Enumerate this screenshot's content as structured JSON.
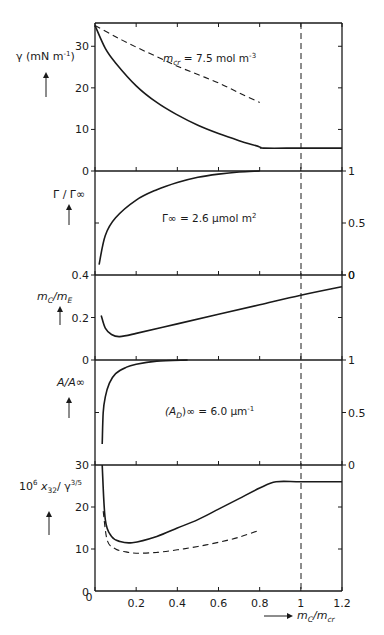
{
  "chart_data": {
    "type": "line",
    "layout": "five vertically stacked panels sharing x-axis",
    "xlabel": "m_C / m_cr",
    "xlim": [
      0,
      1.2
    ],
    "x_ticks": [
      "0",
      "0.2",
      "0.4",
      "0.6",
      "0.8",
      "1",
      "1.2"
    ],
    "vertical_reference_line": {
      "x": 1.0,
      "style": "dashed"
    },
    "panels": [
      {
        "id": "gamma",
        "ylabel": "γ (mN m⁻¹)",
        "yaxis_side": "left",
        "ylim": [
          0,
          35
        ],
        "y_ticks": [
          "0",
          "10",
          "20",
          "30"
        ],
        "annotation": "m_cr = 7.5 mol m⁻³",
        "series": [
          {
            "name": "solid",
            "style": "solid",
            "x": [
              0,
              0.05,
              0.1,
              0.2,
              0.3,
              0.4,
              0.5,
              0.6,
              0.7,
              0.8,
              0.82,
              1.0,
              1.2
            ],
            "y": [
              35,
              29.5,
              26,
              20.5,
              16.5,
              13.5,
              11,
              9,
              7.3,
              5.8,
              5.5,
              5.5,
              5.5
            ]
          },
          {
            "name": "dashed",
            "style": "dashed",
            "x": [
              0,
              0.1,
              0.2,
              0.3,
              0.4,
              0.5,
              0.6,
              0.7,
              0.8
            ],
            "y": [
              35,
              32.3,
              29.8,
              27.5,
              25.2,
              23.2,
              21.2,
              18.8,
              16.5
            ]
          }
        ]
      },
      {
        "id": "gamma_ratio",
        "ylabel": "Γ / Γ∞",
        "yaxis_side": "right",
        "ylim": [
          0,
          1
        ],
        "y_ticks": [
          "0",
          "0.5",
          "1"
        ],
        "annotation": "Γ∞ = 2.6 μmol m²",
        "series": [
          {
            "name": "solid",
            "style": "solid",
            "x": [
              0.02,
              0.05,
              0.1,
              0.2,
              0.3,
              0.4,
              0.5,
              0.6,
              0.7,
              0.8
            ],
            "y": [
              0.1,
              0.38,
              0.55,
              0.72,
              0.82,
              0.89,
              0.94,
              0.97,
              0.99,
              1.0
            ]
          }
        ]
      },
      {
        "id": "mc_me",
        "ylabel": "m_C / m_E",
        "yaxis_side": "left",
        "ylim": [
          0,
          0.4
        ],
        "y_ticks": [
          "0",
          "0.2",
          "0.4"
        ],
        "series": [
          {
            "name": "solid",
            "style": "solid",
            "x": [
              0.03,
              0.05,
              0.08,
              0.12,
              0.2,
              0.4,
              0.6,
              0.8,
              1.0,
              1.2
            ],
            "y": [
              0.21,
              0.15,
              0.12,
              0.11,
              0.125,
              0.17,
              0.215,
              0.26,
              0.305,
              0.345
            ]
          }
        ]
      },
      {
        "id": "area_ratio",
        "ylabel": "A / A∞",
        "yaxis_side": "right",
        "ylim": [
          0,
          1
        ],
        "y_ticks": [
          "0",
          "0.5",
          "1"
        ],
        "annotation": "(A_D)∞ = 6.0 μm⁻¹",
        "series": [
          {
            "name": "solid",
            "style": "solid",
            "x": [
              0.035,
              0.04,
              0.05,
              0.07,
              0.1,
              0.15,
              0.2,
              0.3,
              0.45
            ],
            "y": [
              0.2,
              0.5,
              0.65,
              0.78,
              0.87,
              0.93,
              0.96,
              0.99,
              1.0
            ]
          }
        ]
      },
      {
        "id": "x32",
        "ylabel": "10⁶ x₃₂ / γ^(3/5)",
        "yaxis_side": "left",
        "ylim": [
          0,
          30
        ],
        "y_ticks": [
          "0",
          "10",
          "20",
          "30"
        ],
        "series": [
          {
            "name": "solid",
            "style": "solid",
            "x": [
              0.035,
              0.05,
              0.08,
              0.12,
              0.18,
              0.3,
              0.4,
              0.5,
              0.6,
              0.7,
              0.8,
              0.88,
              1.0,
              1.2
            ],
            "y": [
              30,
              17,
              13,
              11.8,
              11.5,
              13,
              15,
              17,
              19.5,
              22,
              24.5,
              26,
              26,
              26
            ]
          },
          {
            "name": "dashed",
            "style": "dashed",
            "x": [
              0.04,
              0.06,
              0.1,
              0.15,
              0.2,
              0.3,
              0.4,
              0.5,
              0.6,
              0.7,
              0.8
            ],
            "y": [
              19,
              12,
              10,
              9.3,
              9,
              9.2,
              9.8,
              10.6,
              11.6,
              12.8,
              14.5
            ]
          }
        ]
      }
    ]
  },
  "labels": {
    "gamma_ylabel": "γ (mN m",
    "gamma_ylabel_sup": "-1",
    "gamma_ylabel_end": ")",
    "gamma_annot_m": "m",
    "gamma_annot_sub": "cr",
    "gamma_annot_rest": " = 7.5 mol m",
    "gamma_annot_sup": "-3",
    "Gamma_ylabel": "Γ / Γ∞",
    "Gamma_annot": "Γ∞ = 2.6 μmol m",
    "Gamma_annot_sup": "2",
    "mc_ylabel_m1": "m",
    "mc_ylabel_s1": "C",
    "mc_ylabel_m2": "/m",
    "mc_ylabel_s2": "E",
    "A_ylabel": "A/A∞",
    "A_annot_open": "(A",
    "A_annot_sub": "D",
    "A_annot_rest": ")∞ = 6.0 μm",
    "A_annot_sup": "-1",
    "x32_ylabel_10": "10",
    "x32_ylabel_6": "6",
    "x32_ylabel_x": " x",
    "x32_ylabel_32": "32",
    "x32_ylabel_rest": "/ γ",
    "x32_ylabel_exp": "3/5",
    "xlabel_m": "m",
    "xlabel_c": "C",
    "xlabel_slash": "/m",
    "xlabel_cr": "cr",
    "ticks": {
      "x": [
        "0",
        "0.2",
        "0.4",
        "0.6",
        "0.8",
        "1",
        "1.2"
      ],
      "gamma": [
        "0",
        "10",
        "20",
        "30"
      ],
      "Gamma_right": [
        "0",
        "0.5",
        "1"
      ],
      "mc_left": [
        "0",
        "0.2",
        "0.4"
      ],
      "mc_right": [
        "0",
        "1"
      ],
      "A_right": [
        "0",
        "0.5",
        "1"
      ],
      "x32_left": [
        "0",
        "10",
        "20",
        "30"
      ],
      "x32_right": [
        "0"
      ]
    }
  }
}
